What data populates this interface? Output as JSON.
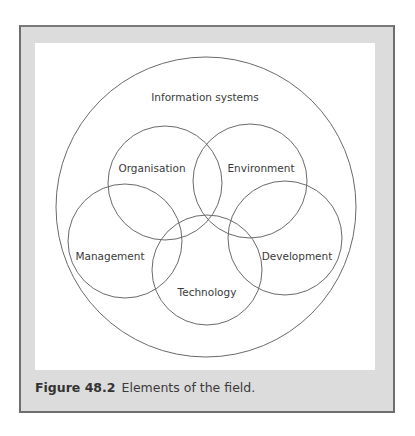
{
  "figure": {
    "caption_label": "Figure 48.2",
    "caption_text": "Elements of the field.",
    "colors": {
      "frame_background": "#dcdcdc",
      "frame_border": "#6e6e6e",
      "panel_background": "#ffffff",
      "line": "#6a6a6a",
      "text": "#3a3a3a"
    }
  },
  "diagram": {
    "outer": {
      "label": "Information systems"
    },
    "elements": [
      {
        "id": "organisation",
        "label": "Organisation"
      },
      {
        "id": "environment",
        "label": "Environment"
      },
      {
        "id": "management",
        "label": "Management"
      },
      {
        "id": "development",
        "label": "Development"
      },
      {
        "id": "technology",
        "label": "Technology"
      }
    ]
  }
}
